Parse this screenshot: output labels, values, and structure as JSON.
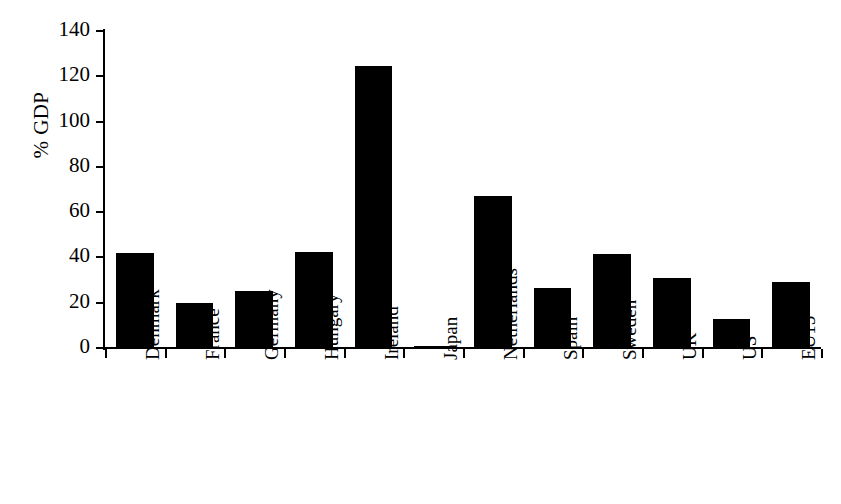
{
  "chart_data": {
    "type": "bar",
    "title": "",
    "subtitle": "",
    "xlabel": "",
    "ylabel": "% GDP",
    "ylim": [
      0,
      140
    ],
    "ytick_values": [
      0,
      20,
      40,
      60,
      80,
      100,
      120,
      140
    ],
    "ytick_labels": [
      "0",
      "20",
      "40",
      "60",
      "80",
      "100",
      "120",
      "140"
    ],
    "grid": false,
    "legend": null,
    "legend_position": "none",
    "orientation": "vertical",
    "bar_color": "#000000",
    "categories": [
      "Denmark",
      "France",
      "Germany",
      "Hungary",
      "Ireland",
      "Japan",
      "Netherlands",
      "Spain",
      "Sweden",
      "UK",
      "US",
      "EU15"
    ],
    "values": [
      42,
      20,
      25,
      42.5,
      124.5,
      1,
      67,
      26.5,
      41.5,
      31,
      13,
      29
    ],
    "annotations": []
  }
}
